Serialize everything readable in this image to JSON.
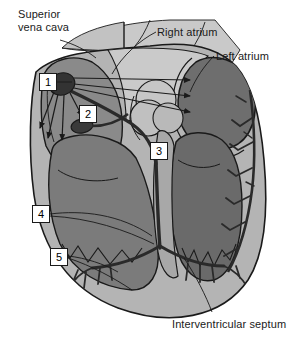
{
  "figure": {
    "background_color": "#ffffff",
    "width": 295,
    "height": 350
  },
  "palette": {
    "outline": "#1a1a1a",
    "myocardium_light": "#b4b4b4",
    "chamber_mid": "#8c8c8c",
    "chamber_dark": "#6e6e6e",
    "vessel_pale": "#c9c9c9",
    "node_dark": "#3c3c3c",
    "label_text": "#1a1a1a",
    "box_fill": "#ffffff"
  },
  "text_labels": [
    {
      "id": "superior-vena-cava",
      "text": "Superior\nvena cava",
      "x": 18,
      "y": 8
    },
    {
      "id": "right-atrium",
      "text": "Right atrium",
      "x": 157,
      "y": 26
    },
    {
      "id": "left-atrium",
      "text": "Left atrium",
      "x": 216,
      "y": 50
    },
    {
      "id": "interventricular-septum",
      "text": "Interventricular septum",
      "x": 172,
      "y": 318
    }
  ],
  "numbered_labels": [
    {
      "id": "label-1",
      "number": "1",
      "x": 39,
      "y": 73
    },
    {
      "id": "label-2",
      "number": "2",
      "x": 79,
      "y": 105
    },
    {
      "id": "label-3",
      "number": "3",
      "x": 150,
      "y": 142
    },
    {
      "id": "label-4",
      "number": "4",
      "x": 32,
      "y": 205
    },
    {
      "id": "label-5",
      "number": "5",
      "x": 50,
      "y": 248
    }
  ],
  "leader_lines": [
    {
      "id": "leader-superior-vena-cava",
      "from": "superior-vena-cava",
      "to": "vena cava trunk"
    },
    {
      "id": "leader-right-atrium",
      "from": "right-atrium",
      "to": "right atrium chamber"
    },
    {
      "id": "leader-left-atrium",
      "from": "left-atrium",
      "to": "left atrium chamber"
    },
    {
      "id": "leader-interventricular-septum",
      "from": "interventricular-septum",
      "to": "septum wall"
    },
    {
      "id": "leader-1",
      "from": "label-1",
      "to": "sinoatrial node"
    },
    {
      "id": "leader-2",
      "from": "label-2",
      "to": "atrioventricular node"
    },
    {
      "id": "leader-3",
      "from": "label-3",
      "to": "bundle of His"
    },
    {
      "id": "leader-4",
      "from": "label-4",
      "to": "bundle branch"
    },
    {
      "id": "leader-5",
      "from": "label-5",
      "to": "purkinje fibers"
    }
  ]
}
